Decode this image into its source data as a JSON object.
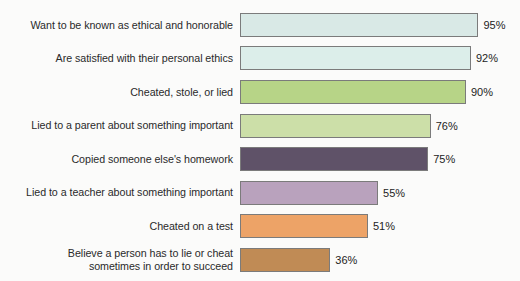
{
  "chart_data": {
    "type": "bar",
    "orientation": "horizontal",
    "title": "",
    "subtitle": "",
    "xlabel": "",
    "ylabel": "",
    "xlim": [
      0,
      100
    ],
    "grid": false,
    "legend": null,
    "value_suffix": "%",
    "categories": [
      "Want to be known as ethical and honorable",
      "Are satisfied with their personal ethics",
      "Cheated, stole, or lied",
      "Lied to a parent about something important",
      "Copied someone else's homework",
      "Lied to a teacher about something important",
      "Cheated on a test",
      "Believe a person has to lie or cheat\nsometimes in order to succeed"
    ],
    "values": [
      95,
      92,
      90,
      76,
      75,
      55,
      51,
      36
    ],
    "value_labels": [
      "95%",
      "92%",
      "90%",
      "76%",
      "75%",
      "55%",
      "51%",
      "36%"
    ],
    "bar_colors": [
      "#d9e9e6",
      "#dceeea",
      "#b7d487",
      "#ccdfa8",
      "#5f5268",
      "#b9a2bd",
      "#eda367",
      "#c08b55"
    ],
    "bar_border_color": "#7b7b7b",
    "background_color": "#fbfbfa",
    "label_color": "#2a2a2a",
    "value_color": "#232323"
  }
}
